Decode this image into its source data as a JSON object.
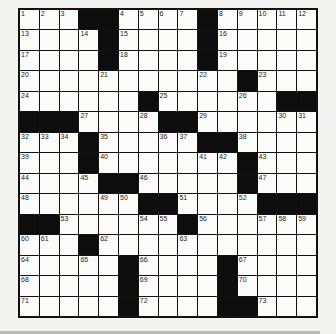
{
  "puzzle": {
    "rows": 15,
    "cols": 15,
    "layout": [
      "...##....#.....",
      "....#....#.....",
      "....#....#.....",
      "...........#...",
      "......#......##",
      "###....##......",
      "...#.....##....",
      "...#.......#...",
      "....##.....#...",
      "......##....###",
      "##......#......",
      "...#...........",
      ".....#....#....",
      ".....#....#....",
      ".....#....##..."
    ],
    "numbers": [
      {
        "r": 0,
        "c": 0,
        "n": "1"
      },
      {
        "r": 0,
        "c": 1,
        "n": "2"
      },
      {
        "r": 0,
        "c": 2,
        "n": "3"
      },
      {
        "r": 0,
        "c": 5,
        "n": "4"
      },
      {
        "r": 0,
        "c": 6,
        "n": "5"
      },
      {
        "r": 0,
        "c": 7,
        "n": "6"
      },
      {
        "r": 0,
        "c": 8,
        "n": "7"
      },
      {
        "r": 0,
        "c": 10,
        "n": "8"
      },
      {
        "r": 0,
        "c": 11,
        "n": "9"
      },
      {
        "r": 0,
        "c": 12,
        "n": "10"
      },
      {
        "r": 0,
        "c": 13,
        "n": "11"
      },
      {
        "r": 0,
        "c": 14,
        "n": "12"
      },
      {
        "r": 1,
        "c": 0,
        "n": "13"
      },
      {
        "r": 1,
        "c": 3,
        "n": "14"
      },
      {
        "r": 1,
        "c": 5,
        "n": "15"
      },
      {
        "r": 1,
        "c": 10,
        "n": "16"
      },
      {
        "r": 2,
        "c": 0,
        "n": "17"
      },
      {
        "r": 2,
        "c": 5,
        "n": "18"
      },
      {
        "r": 2,
        "c": 10,
        "n": "19"
      },
      {
        "r": 3,
        "c": 0,
        "n": "20"
      },
      {
        "r": 3,
        "c": 4,
        "n": "21"
      },
      {
        "r": 3,
        "c": 9,
        "n": "22"
      },
      {
        "r": 3,
        "c": 12,
        "n": "23"
      },
      {
        "r": 4,
        "c": 0,
        "n": "24"
      },
      {
        "r": 4,
        "c": 7,
        "n": "25"
      },
      {
        "r": 4,
        "c": 11,
        "n": "26"
      },
      {
        "r": 5,
        "c": 3,
        "n": "27"
      },
      {
        "r": 5,
        "c": 6,
        "n": "28"
      },
      {
        "r": 5,
        "c": 9,
        "n": "29"
      },
      {
        "r": 5,
        "c": 13,
        "n": "30"
      },
      {
        "r": 5,
        "c": 14,
        "n": "31"
      },
      {
        "r": 6,
        "c": 0,
        "n": "32"
      },
      {
        "r": 6,
        "c": 1,
        "n": "33"
      },
      {
        "r": 6,
        "c": 2,
        "n": "34"
      },
      {
        "r": 6,
        "c": 4,
        "n": "35"
      },
      {
        "r": 6,
        "c": 7,
        "n": "36"
      },
      {
        "r": 6,
        "c": 8,
        "n": "37"
      },
      {
        "r": 6,
        "c": 11,
        "n": "38"
      },
      {
        "r": 7,
        "c": 0,
        "n": "39"
      },
      {
        "r": 7,
        "c": 4,
        "n": "40"
      },
      {
        "r": 7,
        "c": 9,
        "n": "41"
      },
      {
        "r": 7,
        "c": 10,
        "n": "42"
      },
      {
        "r": 7,
        "c": 12,
        "n": "43"
      },
      {
        "r": 8,
        "c": 0,
        "n": "44"
      },
      {
        "r": 8,
        "c": 3,
        "n": "45"
      },
      {
        "r": 8,
        "c": 6,
        "n": "46"
      },
      {
        "r": 8,
        "c": 12,
        "n": "47"
      },
      {
        "r": 9,
        "c": 0,
        "n": "48"
      },
      {
        "r": 9,
        "c": 4,
        "n": "49"
      },
      {
        "r": 9,
        "c": 5,
        "n": "50"
      },
      {
        "r": 9,
        "c": 8,
        "n": "51"
      },
      {
        "r": 9,
        "c": 11,
        "n": "52"
      },
      {
        "r": 10,
        "c": 2,
        "n": "53"
      },
      {
        "r": 10,
        "c": 6,
        "n": "54"
      },
      {
        "r": 10,
        "c": 7,
        "n": "55"
      },
      {
        "r": 10,
        "c": 9,
        "n": "56"
      },
      {
        "r": 10,
        "c": 12,
        "n": "57"
      },
      {
        "r": 10,
        "c": 13,
        "n": "58"
      },
      {
        "r": 10,
        "c": 14,
        "n": "59"
      },
      {
        "r": 11,
        "c": 0,
        "n": "60"
      },
      {
        "r": 11,
        "c": 1,
        "n": "61"
      },
      {
        "r": 11,
        "c": 4,
        "n": "62"
      },
      {
        "r": 11,
        "c": 8,
        "n": "63"
      },
      {
        "r": 12,
        "c": 0,
        "n": "64"
      },
      {
        "r": 12,
        "c": 3,
        "n": "65"
      },
      {
        "r": 12,
        "c": 6,
        "n": "66"
      },
      {
        "r": 12,
        "c": 11,
        "n": "67"
      },
      {
        "r": 13,
        "c": 0,
        "n": "68"
      },
      {
        "r": 13,
        "c": 6,
        "n": "69"
      },
      {
        "r": 13,
        "c": 11,
        "n": "70"
      },
      {
        "r": 14,
        "c": 0,
        "n": "71"
      },
      {
        "r": 14,
        "c": 6,
        "n": "72"
      },
      {
        "r": 14,
        "c": 12,
        "n": "73"
      }
    ]
  },
  "colors": {
    "block": "#0d0d0d",
    "cell": "#fbfbfa",
    "background": "#f3f3f1"
  }
}
